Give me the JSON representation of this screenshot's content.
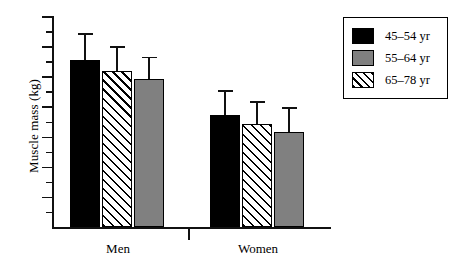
{
  "chart_data": {
    "type": "bar",
    "title": "",
    "subtitle": "",
    "xlabel": "",
    "ylabel": "Muscle mass (kg)",
    "categories": [
      "Men",
      "Women"
    ],
    "grid": false,
    "legend_position": "top-right",
    "y_axis": {
      "labels_shown": false,
      "tick_count_major": 7,
      "tick_count_minor": 7,
      "note": "Y axis has unlabeled alternating major and minor tick marks"
    },
    "error_bars": {
      "style": "upper-whisker-only",
      "description": "Single upward error bar with cap on each bar"
    },
    "bar_render_order": [
      "45–54 yr",
      "65–78 yr",
      "55–64 yr"
    ],
    "series": [
      {
        "name": "45–54 yr",
        "fill": "solid-black",
        "color": "#000000",
        "values": [
          79,
          53
        ],
        "errors": [
          12,
          11
        ]
      },
      {
        "name": "55–64 yr",
        "fill": "solid-gray",
        "color": "#808080",
        "values": [
          70,
          45
        ],
        "errors": [
          10,
          11
        ]
      },
      {
        "name": "65–78 yr",
        "fill": "hatched",
        "color": "#ffffff",
        "values": [
          74,
          49
        ],
        "errors": [
          11,
          10
        ]
      }
    ],
    "ylim": [
      0,
      100
    ]
  },
  "legend": {
    "items": [
      {
        "label": "45–54 yr",
        "fill": "solid-black"
      },
      {
        "label": "55–64 yr",
        "fill": "solid-gray"
      },
      {
        "label": "65–78 yr",
        "fill": "hatched"
      }
    ]
  },
  "axis": {
    "x_tick_labels": [
      "Men",
      "Women"
    ]
  },
  "colors": {
    "black": "#000000",
    "gray": "#808080",
    "axis": "#111111",
    "background": "#ffffff"
  }
}
